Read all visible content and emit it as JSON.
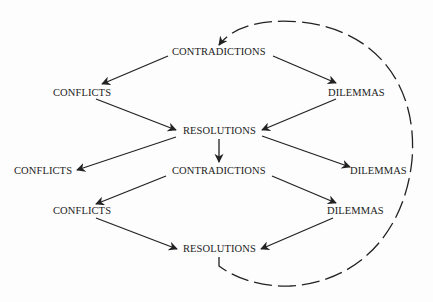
{
  "diagram": {
    "type": "cyclic flow diagram",
    "nodes": [
      {
        "id": "contradictions_1",
        "label": "CONTRADICTIONS",
        "x": 172,
        "y": 46
      },
      {
        "id": "conflicts_1",
        "label": "CONFLICTS",
        "x": 53,
        "y": 87
      },
      {
        "id": "dilemmas_1",
        "label": "DILEMMAS",
        "x": 328,
        "y": 87
      },
      {
        "id": "resolutions_1",
        "label": "RESOLUTIONS",
        "x": 183,
        "y": 125
      },
      {
        "id": "conflicts_2",
        "label": "CONFLICTS",
        "x": 14,
        "y": 165
      },
      {
        "id": "contradictions_2",
        "label": "CONTRADICTIONS",
        "x": 172,
        "y": 165
      },
      {
        "id": "dilemmas_2",
        "label": "DILEMMAS",
        "x": 350,
        "y": 165
      },
      {
        "id": "conflicts_3",
        "label": "CONFLICTS",
        "x": 53,
        "y": 205
      },
      {
        "id": "dilemmas_3",
        "label": "DILEMMAS",
        "x": 327,
        "y": 205
      },
      {
        "id": "resolutions_2",
        "label": "RESOLUTIONS",
        "x": 183,
        "y": 243
      }
    ],
    "edges": [
      {
        "from": "contradictions_1",
        "to": "conflicts_1"
      },
      {
        "from": "contradictions_1",
        "to": "dilemmas_1"
      },
      {
        "from": "conflicts_1",
        "to": "resolutions_1"
      },
      {
        "from": "dilemmas_1",
        "to": "resolutions_1"
      },
      {
        "from": "resolutions_1",
        "to": "conflicts_2"
      },
      {
        "from": "resolutions_1",
        "to": "contradictions_2"
      },
      {
        "from": "resolutions_1",
        "to": "dilemmas_2"
      },
      {
        "from": "contradictions_2",
        "to": "conflicts_3"
      },
      {
        "from": "contradictions_2",
        "to": "dilemmas_3"
      },
      {
        "from": "conflicts_3",
        "to": "resolutions_2"
      },
      {
        "from": "dilemmas_3",
        "to": "resolutions_2"
      },
      {
        "from": "resolutions_2",
        "to": "contradictions_1",
        "style": "dashed",
        "shape": "loop"
      }
    ],
    "colors": {
      "stroke": "#222222",
      "background": "#fdfdfd"
    }
  }
}
